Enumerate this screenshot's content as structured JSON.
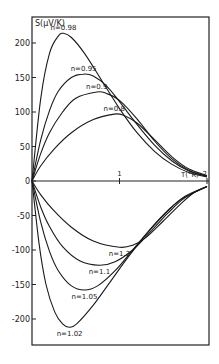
{
  "chart_data": {
    "type": "line",
    "title": "",
    "xlabel": "T (°K)",
    "ylabel": "S (µV/K)",
    "xlim": [
      0,
      2
    ],
    "ylim": [
      -240,
      240
    ],
    "x_ticks": [
      1,
      2
    ],
    "x_tick_labels": [
      "1",
      "2"
    ],
    "y_ticks": [
      200,
      150,
      100,
      50,
      0,
      -50,
      -100,
      -150,
      -200
    ],
    "y_tick_labels": [
      "200",
      "150",
      "100",
      "50",
      "0",
      "-50",
      "-100",
      "-150",
      "-200"
    ],
    "grid": false,
    "legend": "inline curve labels",
    "series": [
      {
        "name": "n=0.98",
        "label": "n=0.98",
        "peak": {
          "T": 0.36,
          "S": 214
        },
        "points": [
          [
            0,
            0
          ],
          [
            0.1,
            120
          ],
          [
            0.2,
            185
          ],
          [
            0.3,
            210
          ],
          [
            0.36,
            214
          ],
          [
            0.45,
            208
          ],
          [
            0.6,
            185
          ],
          [
            0.8,
            145
          ],
          [
            1.0,
            105
          ],
          [
            1.2,
            70
          ],
          [
            1.4,
            43
          ],
          [
            1.6,
            24
          ],
          [
            1.8,
            12
          ],
          [
            2.0,
            6
          ]
        ]
      },
      {
        "name": "n=0.95",
        "label": "n=0.95",
        "peak": {
          "T": 0.59,
          "S": 155
        },
        "points": [
          [
            0,
            0
          ],
          [
            0.1,
            60
          ],
          [
            0.2,
            102
          ],
          [
            0.3,
            130
          ],
          [
            0.45,
            150
          ],
          [
            0.59,
            155
          ],
          [
            0.7,
            152
          ],
          [
            0.85,
            138
          ],
          [
            1.0,
            115
          ],
          [
            1.2,
            82
          ],
          [
            1.4,
            52
          ],
          [
            1.6,
            29
          ],
          [
            1.8,
            14
          ],
          [
            2.0,
            7
          ]
        ]
      },
      {
        "name": "n=0.9",
        "label": "n=0.9",
        "peak": {
          "T": 0.74,
          "S": 129
        },
        "points": [
          [
            0,
            0
          ],
          [
            0.1,
            40
          ],
          [
            0.2,
            70
          ],
          [
            0.35,
            100
          ],
          [
            0.5,
            120
          ],
          [
            0.74,
            129
          ],
          [
            0.85,
            127
          ],
          [
            1.0,
            117
          ],
          [
            1.2,
            90
          ],
          [
            1.4,
            58
          ],
          [
            1.6,
            32
          ],
          [
            1.8,
            15
          ],
          [
            2.0,
            7
          ]
        ]
      },
      {
        "name": "n=0.8",
        "label": "n=0.8",
        "peak": {
          "T": 0.94,
          "S": 97
        },
        "points": [
          [
            0,
            0
          ],
          [
            0.1,
            22
          ],
          [
            0.25,
            46
          ],
          [
            0.45,
            70
          ],
          [
            0.7,
            89
          ],
          [
            0.94,
            97
          ],
          [
            1.05,
            95
          ],
          [
            1.2,
            84
          ],
          [
            1.4,
            60
          ],
          [
            1.6,
            35
          ],
          [
            1.8,
            17
          ],
          [
            2.0,
            8
          ]
        ]
      },
      {
        "name": "n=1.2",
        "label": "n=1.2",
        "trough": {
          "T": 1.0,
          "S": -96
        },
        "points": [
          [
            0,
            0
          ],
          [
            0.1,
            -20
          ],
          [
            0.25,
            -43
          ],
          [
            0.45,
            -67
          ],
          [
            0.7,
            -87
          ],
          [
            1.0,
            -96
          ],
          [
            1.15,
            -93
          ],
          [
            1.3,
            -82
          ],
          [
            1.5,
            -58
          ],
          [
            1.7,
            -33
          ],
          [
            1.85,
            -17
          ],
          [
            2.0,
            -8
          ]
        ]
      },
      {
        "name": "n=1.1",
        "label": "n=1.1",
        "trough": {
          "T": 0.77,
          "S": -122
        },
        "points": [
          [
            0,
            0
          ],
          [
            0.1,
            -38
          ],
          [
            0.2,
            -66
          ],
          [
            0.35,
            -95
          ],
          [
            0.55,
            -116
          ],
          [
            0.77,
            -122
          ],
          [
            0.95,
            -117
          ],
          [
            1.15,
            -100
          ],
          [
            1.35,
            -74
          ],
          [
            1.55,
            -47
          ],
          [
            1.75,
            -24
          ],
          [
            2.0,
            -8
          ]
        ]
      },
      {
        "name": "n=1.05",
        "label": "n=1.05",
        "trough": {
          "T": 0.6,
          "S": -158
        },
        "points": [
          [
            0,
            0
          ],
          [
            0.1,
            -60
          ],
          [
            0.2,
            -102
          ],
          [
            0.3,
            -130
          ],
          [
            0.45,
            -152
          ],
          [
            0.6,
            -158
          ],
          [
            0.75,
            -152
          ],
          [
            0.95,
            -130
          ],
          [
            1.15,
            -100
          ],
          [
            1.35,
            -70
          ],
          [
            1.55,
            -43
          ],
          [
            1.75,
            -22
          ],
          [
            2.0,
            -8
          ]
        ]
      },
      {
        "name": "n=1.02",
        "label": "n=1.02",
        "trough": {
          "T": 0.43,
          "S": -212
        },
        "points": [
          [
            0,
            0
          ],
          [
            0.08,
            -90
          ],
          [
            0.16,
            -150
          ],
          [
            0.26,
            -190
          ],
          [
            0.35,
            -207
          ],
          [
            0.43,
            -212
          ],
          [
            0.52,
            -206
          ],
          [
            0.7,
            -180
          ],
          [
            0.9,
            -145
          ],
          [
            1.1,
            -110
          ],
          [
            1.3,
            -78
          ],
          [
            1.5,
            -50
          ],
          [
            1.7,
            -27
          ],
          [
            2.0,
            -8
          ]
        ]
      }
    ]
  },
  "axes": {
    "y_title": "S(µV/K)",
    "x_title": "T(°K)"
  }
}
